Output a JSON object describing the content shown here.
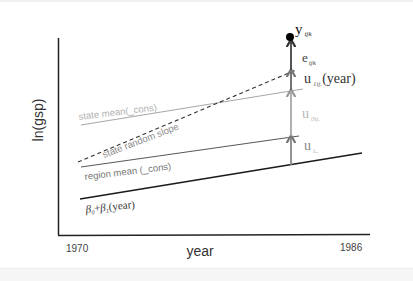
{
  "axes": {
    "ylabel": "ln(gsp)",
    "xlabel": "year",
    "x_start": "1970",
    "x_end": "1986"
  },
  "lines": {
    "fixed": {
      "label_beta0": "β",
      "sub0": "0",
      "plus": "+",
      "label_beta1": "β",
      "sub1": "1",
      "suffix": "(year)",
      "color": "#1a1a1a"
    },
    "region_mean": {
      "label": "region mean (_cons)",
      "color": "#555555"
    },
    "state_mean": {
      "label": "state mean(_cons)",
      "color": "#a8a8a8"
    },
    "state_random_slope": {
      "label": "state random slope",
      "color": "#333333"
    }
  },
  "components": {
    "y": {
      "base": "y",
      "sub": "ijk"
    },
    "e": {
      "base": "e",
      "sub": "ijk"
    },
    "u1": {
      "base": "u",
      "sub": "1ij.",
      "suffix": "(year)"
    },
    "u0": {
      "base": "u",
      "sub": "0ij."
    },
    "ui": {
      "base": "u",
      "sub": "i.."
    }
  },
  "colors": {
    "axis": "#222222",
    "dark": "#1a1a1a",
    "mid": "#666666",
    "light": "#a8a8a8",
    "dot": "#000000"
  }
}
